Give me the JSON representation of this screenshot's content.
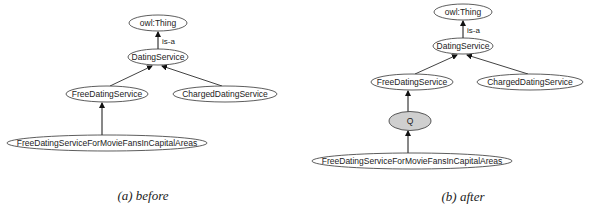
{
  "top_fragment": "after 2",
  "panels": [
    {
      "id": "a",
      "caption": "(a) before",
      "nodes": {
        "thing": "owl:Thing",
        "dating": "DatingService",
        "free": "FreeDatingService",
        "charged": "ChargedDatingService",
        "movie": "FreeDatingServiceForMovieFansInCapitalAreas"
      },
      "edge_label": "is-a"
    },
    {
      "id": "b",
      "caption": "(b) after",
      "nodes": {
        "thing": "owl:Thing",
        "dating": "DatingService",
        "free": "FreeDatingService",
        "charged": "ChargedDatingService",
        "q": "Q",
        "movie": "FreeDatingServiceForMovieFansInCapitalAreas"
      },
      "edge_label": "is-a",
      "highlight_fill": "#cfcfcf"
    }
  ]
}
